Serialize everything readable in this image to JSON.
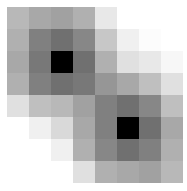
{
  "chart_data": {
    "type": "heatmap",
    "title": "",
    "xlabel": "",
    "ylabel": "",
    "rows": 8,
    "cols": 8,
    "colormap": "grayscale (dark = high)",
    "grid": false,
    "values": [
      [
        0.28,
        0.34,
        0.37,
        0.31,
        0.09,
        0.0,
        0.0,
        0.0
      ],
      [
        0.31,
        0.5,
        0.56,
        0.47,
        0.22,
        0.06,
        0.01,
        0.0
      ],
      [
        0.34,
        0.53,
        1.0,
        0.56,
        0.31,
        0.12,
        0.09,
        0.03
      ],
      [
        0.31,
        0.5,
        0.56,
        0.53,
        0.41,
        0.34,
        0.25,
        0.12
      ],
      [
        0.12,
        0.25,
        0.28,
        0.37,
        0.5,
        0.56,
        0.47,
        0.25
      ],
      [
        0.0,
        0.06,
        0.15,
        0.34,
        0.5,
        1.0,
        0.56,
        0.34
      ],
      [
        0.0,
        0.0,
        0.06,
        0.31,
        0.47,
        0.56,
        0.5,
        0.31
      ],
      [
        0.0,
        0.0,
        0.0,
        0.12,
        0.31,
        0.34,
        0.37,
        0.28
      ]
    ]
  }
}
